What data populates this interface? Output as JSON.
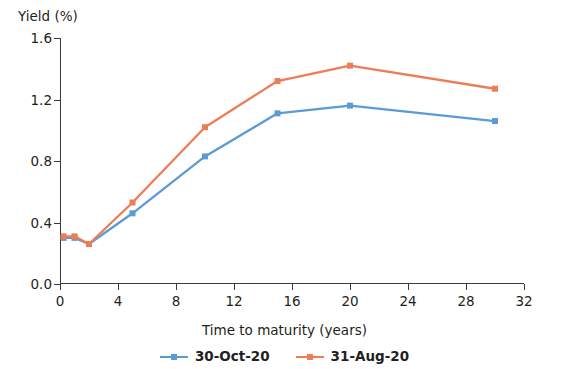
{
  "chart_data": {
    "type": "line",
    "title": "",
    "xlabel": "Time to maturity (years)",
    "ylabel": "Yield (%)",
    "xlim": [
      0,
      32
    ],
    "ylim": [
      0,
      1.6
    ],
    "xticks": [
      "0",
      "4",
      "8",
      "12",
      "16",
      "20",
      "24",
      "28",
      "32"
    ],
    "xtick_values": [
      0,
      4,
      8,
      12,
      16,
      20,
      24,
      28,
      32
    ],
    "yticks": [
      "0.0",
      "0.4",
      "0.8",
      "1.2",
      "1.6"
    ],
    "ytick_values": [
      0,
      0.4,
      0.8,
      1.2,
      1.6
    ],
    "grid": false,
    "legend_position": "bottom",
    "x": [
      0.25,
      1,
      2,
      5,
      10,
      15,
      20,
      30
    ],
    "series": [
      {
        "name": "30-Oct-20",
        "color": "#5b9bd5",
        "marker": "square",
        "values": [
          0.3,
          0.3,
          0.26,
          0.46,
          0.83,
          1.11,
          1.16,
          1.06
        ]
      },
      {
        "name": "31-Aug-20",
        "color": "#ed7d56",
        "marker": "square",
        "values": [
          0.31,
          0.31,
          0.26,
          0.53,
          1.02,
          1.32,
          1.42,
          1.27
        ]
      }
    ]
  },
  "axis": {
    "line_color": "#3b3b3b"
  }
}
